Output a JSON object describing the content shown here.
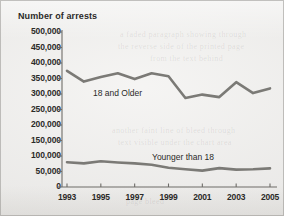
{
  "chart_data": {
    "type": "line",
    "title": "Number of arrests",
    "xlabel": "",
    "ylabel": "Number of arrests",
    "ylim": [
      0,
      500000
    ],
    "xlim": [
      1993,
      2005
    ],
    "grid": false,
    "legend": "inline-labels",
    "x": [
      1993,
      1994,
      1995,
      1996,
      1997,
      1998,
      1999,
      2000,
      2001,
      2002,
      2003,
      2004,
      2005
    ],
    "ytick_labels": [
      "500,000",
      "450,000",
      "400,000",
      "350,000",
      "300,000",
      "250,000",
      "200,000",
      "150,000",
      "100,000",
      "50,000",
      "0"
    ],
    "ytick_values": [
      500000,
      450000,
      400000,
      350000,
      300000,
      250000,
      200000,
      150000,
      100000,
      50000,
      0
    ],
    "xtick_labels": [
      "1993",
      "1995",
      "1997",
      "1999",
      "2001",
      "2003",
      "2005"
    ],
    "xtick_values": [
      1993,
      1995,
      1997,
      1999,
      2001,
      2003,
      2005
    ],
    "series": [
      {
        "name": "18 and Older",
        "label_text": "18 and Older",
        "color": "#7b7a76",
        "values": [
          375000,
          340000,
          355000,
          367000,
          348000,
          367000,
          357000,
          287000,
          298000,
          290000,
          338000,
          303000,
          318000
        ]
      },
      {
        "name": "Younger than 18",
        "label_text": "Younger than 18",
        "color": "#7b7a76",
        "values": [
          80000,
          76000,
          83000,
          79000,
          76000,
          72000,
          62000,
          57000,
          53000,
          61000,
          56000,
          57000,
          60000
        ]
      }
    ]
  },
  "ghost_text": {
    "line1": "a faded paragraph showing through",
    "line2": "the reverse side of the printed page",
    "line3": "from the text behind",
    "line4": "another faint line of bleed through",
    "line5": "text visible under the chart area",
    "line6": "page bleed"
  },
  "colors": {
    "line": "#7b7a76",
    "axis": "#6e6c68",
    "text": "#2b2a28",
    "background": "#f1f0ee"
  }
}
